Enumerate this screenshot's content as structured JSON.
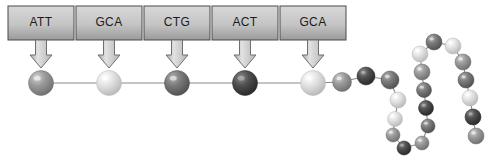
{
  "diagram": {
    "background_color": "#ffffff"
  },
  "codon_boxes": {
    "count": 5,
    "box_fill_light": "#d8d8d8",
    "box_fill_dark": "#9a9a9a",
    "box_border": "#4a4a4a",
    "items": [
      {
        "label": "ATT",
        "x": 8,
        "y": 6,
        "w": 66,
        "h": 34
      },
      {
        "label": "GCA",
        "x": 76,
        "y": 6,
        "w": 66,
        "h": 34
      },
      {
        "label": "CTG",
        "x": 144,
        "y": 6,
        "w": 66,
        "h": 34
      },
      {
        "label": "ACT",
        "x": 212,
        "y": 6,
        "w": 66,
        "h": 34
      },
      {
        "label": "GCA",
        "x": 280,
        "y": 6,
        "w": 66,
        "h": 34
      }
    ]
  },
  "arrows": {
    "fill_light": "#e2e2e2",
    "fill_dark": "#a8a8a8",
    "stroke": "#6f6f6f",
    "items": [
      {
        "cx": 41,
        "top": 40,
        "bottom": 68
      },
      {
        "cx": 109,
        "top": 40,
        "bottom": 68
      },
      {
        "cx": 177,
        "top": 40,
        "bottom": 68
      },
      {
        "cx": 245,
        "top": 40,
        "bottom": 68
      },
      {
        "cx": 313,
        "top": 40,
        "bottom": 68
      }
    ]
  },
  "bond_color": "#8a8a8a",
  "chain": {
    "description": "Polypeptide chain of amino acid spheres folding into a hairpin loop",
    "spheres": [
      {
        "id": 1,
        "cx": 41,
        "cy": 83,
        "r": 12.5,
        "tone": "medium"
      },
      {
        "id": 2,
        "cx": 109,
        "cy": 83,
        "r": 12.5,
        "tone": "pale"
      },
      {
        "id": 3,
        "cx": 177,
        "cy": 83,
        "r": 12.5,
        "tone": "dark"
      },
      {
        "id": 4,
        "cx": 245,
        "cy": 83,
        "r": 12.5,
        "tone": "darkest"
      },
      {
        "id": 5,
        "cx": 313,
        "cy": 83,
        "r": 12.5,
        "tone": "pale"
      },
      {
        "id": 6,
        "cx": 342,
        "cy": 82,
        "r": 9.5,
        "tone": "medium"
      },
      {
        "id": 7,
        "cx": 366,
        "cy": 76,
        "r": 9.0,
        "tone": "darkest"
      },
      {
        "id": 8,
        "cx": 390,
        "cy": 80,
        "r": 9.0,
        "tone": "dark"
      },
      {
        "id": 9,
        "cx": 398,
        "cy": 100,
        "r": 8.0,
        "tone": "pale"
      },
      {
        "id": 10,
        "cx": 395,
        "cy": 119,
        "r": 7.5,
        "tone": "pale"
      },
      {
        "id": 11,
        "cx": 393,
        "cy": 135,
        "r": 7.0,
        "tone": "medium"
      },
      {
        "id": 12,
        "cx": 404,
        "cy": 148,
        "r": 7.0,
        "tone": "darkest"
      },
      {
        "id": 13,
        "cx": 422,
        "cy": 143,
        "r": 7.0,
        "tone": "medium"
      },
      {
        "id": 14,
        "cx": 428,
        "cy": 126,
        "r": 7.0,
        "tone": "dark"
      },
      {
        "id": 15,
        "cx": 426,
        "cy": 108,
        "r": 7.5,
        "tone": "darkest"
      },
      {
        "id": 16,
        "cx": 424,
        "cy": 90,
        "r": 7.5,
        "tone": "dark"
      },
      {
        "id": 17,
        "cx": 422,
        "cy": 72,
        "r": 8.0,
        "tone": "medium"
      },
      {
        "id": 18,
        "cx": 420,
        "cy": 54,
        "r": 8.0,
        "tone": "pale"
      },
      {
        "id": 19,
        "cx": 434,
        "cy": 42,
        "r": 8.0,
        "tone": "dark"
      },
      {
        "id": 20,
        "cx": 453,
        "cy": 46,
        "r": 8.0,
        "tone": "pale"
      },
      {
        "id": 21,
        "cx": 463,
        "cy": 62,
        "r": 8.0,
        "tone": "medium"
      },
      {
        "id": 22,
        "cx": 466,
        "cy": 80,
        "r": 8.0,
        "tone": "dark"
      },
      {
        "id": 23,
        "cx": 470,
        "cy": 98,
        "r": 8.0,
        "tone": "pale"
      },
      {
        "id": 24,
        "cx": 473,
        "cy": 117,
        "r": 8.0,
        "tone": "darkest"
      },
      {
        "id": 25,
        "cx": 476,
        "cy": 136,
        "r": 8.0,
        "tone": "medium"
      }
    ],
    "bonds": [
      [
        1,
        2
      ],
      [
        2,
        3
      ],
      [
        3,
        4
      ],
      [
        4,
        5
      ],
      [
        5,
        6
      ],
      [
        6,
        7
      ],
      [
        7,
        8
      ],
      [
        8,
        9
      ],
      [
        9,
        10
      ],
      [
        10,
        11
      ],
      [
        11,
        12
      ],
      [
        12,
        13
      ],
      [
        13,
        14
      ],
      [
        14,
        15
      ],
      [
        15,
        16
      ],
      [
        16,
        17
      ],
      [
        17,
        18
      ],
      [
        18,
        19
      ],
      [
        19,
        20
      ],
      [
        20,
        21
      ],
      [
        21,
        22
      ],
      [
        22,
        23
      ],
      [
        23,
        24
      ],
      [
        24,
        25
      ]
    ]
  },
  "sphere_tones": {
    "pale": {
      "highlight": "#ffffff",
      "mid": "#e3e3e3",
      "edge": "#b6b6b6"
    },
    "medium": {
      "highlight": "#d2d2d2",
      "mid": "#9b9b9b",
      "edge": "#6d6d6d"
    },
    "dark": {
      "highlight": "#b0b0b0",
      "mid": "#7b7b7b",
      "edge": "#4e4e4e"
    },
    "darkest": {
      "highlight": "#8c8c8c",
      "mid": "#4f4f4f",
      "edge": "#262626"
    }
  }
}
